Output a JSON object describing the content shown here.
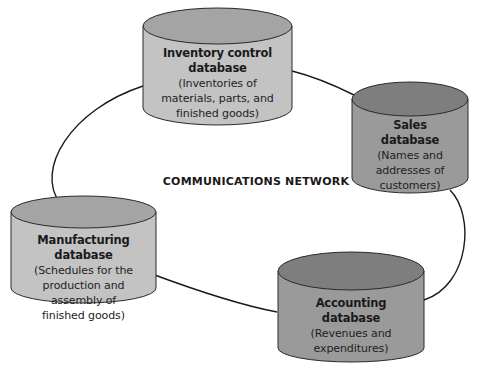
{
  "diagram": {
    "center_label": "COMMUNICATIONS NETWORK",
    "colors": {
      "light_body": "#c3c3c3",
      "light_top": "#a4a4a4",
      "dark_body": "#9a9a9a",
      "dark_top": "#7e7e7e",
      "outline": "#2a2a2a",
      "network_line": "#1a1a1a"
    },
    "databases": [
      {
        "id": "inventory",
        "title": "Inventory control database",
        "title_lines": [
          "Inventory control",
          "database"
        ],
        "description_lines": [
          "(Inventories of",
          "materials, parts, and",
          "finished goods)"
        ],
        "shade": "light"
      },
      {
        "id": "sales",
        "title": "Sales database",
        "title_lines": [
          "Sales",
          "database"
        ],
        "description_lines": [
          "(Names and",
          "addresses of",
          "customers)"
        ],
        "shade": "dark"
      },
      {
        "id": "accounting",
        "title": "Accounting database",
        "title_lines": [
          "Accounting",
          "database"
        ],
        "description_lines": [
          "(Revenues and",
          "expenditures)"
        ],
        "shade": "dark"
      },
      {
        "id": "manufacturing",
        "title": "Manufacturing database",
        "title_lines": [
          "Manufacturing database"
        ],
        "description_lines": [
          "(Schedules for the",
          "production and",
          "assembly of",
          "finished goods)"
        ],
        "shade": "light"
      }
    ]
  }
}
